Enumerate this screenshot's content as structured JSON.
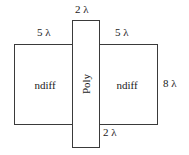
{
  "figure": {
    "background_color": "#ffffff",
    "line_color": "#3a3a3a",
    "text_color": "#1a1a1a"
  },
  "regions": {
    "ndiff_left_label": "ndiff",
    "ndiff_right_label": "ndiff",
    "poly_label": "Poly"
  },
  "dimensions": {
    "poly_width_top": "2 λ",
    "ndiff_left_width": "5 λ",
    "ndiff_right_width": "5 λ",
    "ndiff_height": "8 λ",
    "poly_overhang_bottom": "2 λ"
  }
}
